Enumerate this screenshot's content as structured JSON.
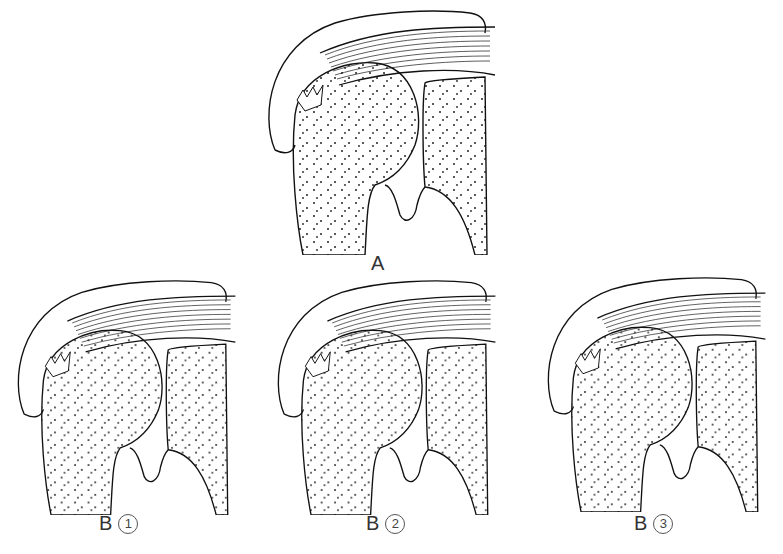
{
  "figure": {
    "panels": [
      {
        "id": "A",
        "letter": "A",
        "number": ""
      },
      {
        "id": "B1",
        "letter": "B",
        "number": "1"
      },
      {
        "id": "B2",
        "letter": "B",
        "number": "2"
      },
      {
        "id": "B3",
        "letter": "B",
        "number": "3"
      }
    ]
  }
}
